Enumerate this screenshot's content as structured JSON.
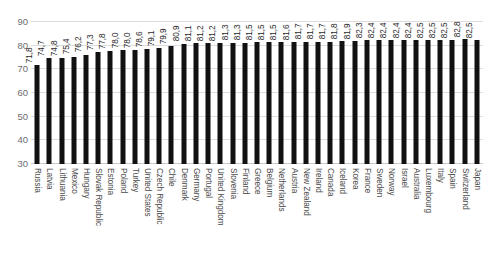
{
  "chart_data": {
    "type": "bar",
    "title": "",
    "subtitle": "",
    "xlabel": "",
    "ylabel": "",
    "ylim": [
      30,
      90
    ],
    "y_ticks": [
      30,
      40,
      50,
      60,
      70,
      80,
      90
    ],
    "grid": true,
    "legend": false,
    "legend_position": "none",
    "orientation": "vertical",
    "bar_color": "#111111",
    "value_label_decimal_separator": ",",
    "categories": [
      "Russia",
      "Latvia",
      "Lithuania",
      "Mexico",
      "Hungary",
      "Slovak Republic",
      "Estonia",
      "Poland",
      "Turkey",
      "United States",
      "Czech Republic",
      "Chile",
      "Denmark",
      "Germany",
      "Portugal",
      "United Kingdom",
      "Slovenia",
      "Finland",
      "Greece",
      "Belgium",
      "Netherlands",
      "Austria",
      "New Zealand",
      "Ireland",
      "Canada",
      "Iceland",
      "Korea",
      "France",
      "Sweden",
      "Norway",
      "Israel",
      "Australia",
      "Luxembourg",
      "Italy",
      "Spain",
      "Switzerland",
      "Japan"
    ],
    "values": [
      71.8,
      74.7,
      74.8,
      75.4,
      76.2,
      77.3,
      77.8,
      78.0,
      78.0,
      78.6,
      79.1,
      79.9,
      80.9,
      81.1,
      81.2,
      81.2,
      81.3,
      81.3,
      81.5,
      81.5,
      81.5,
      81.6,
      81.7,
      81.7,
      81.7,
      81.8,
      81.9,
      82.3,
      82.4,
      82.4,
      82.4,
      82.4,
      82.5,
      82.5,
      82.5,
      82.8,
      82.5
    ],
    "value_labels": [
      "71,8",
      "74,7",
      "74,8",
      "75,4",
      "76,2",
      "77,3",
      "77,8",
      "78,0",
      "78,0",
      "78,6",
      "79,1",
      "79,9",
      "80,9",
      "81,1",
      "81,2",
      "81,2",
      "81,3",
      "81,3",
      "81,5",
      "81,5",
      "81,5",
      "81,6",
      "81,7",
      "81,7",
      "81,7",
      "81,8",
      "81,9",
      "82,3",
      "82,4",
      "82,4",
      "82,4",
      "82,4",
      "82,5",
      "82,5",
      "82,5",
      "82,8",
      "82,5"
    ],
    "y_tick_labels": [
      "30",
      "40",
      "50",
      "60",
      "70",
      "80",
      "90"
    ]
  }
}
